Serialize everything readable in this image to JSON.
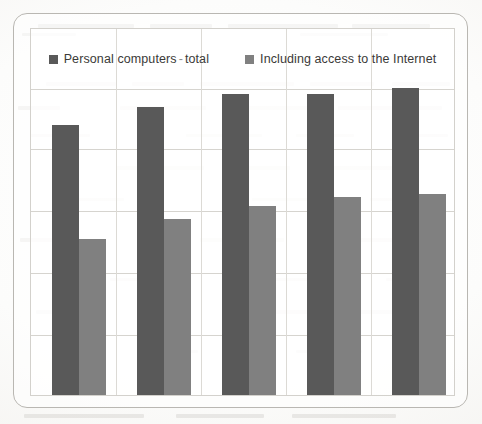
{
  "figure": {
    "frame_color": "#b9b7b2",
    "plot_border_color": "#d3d1cc",
    "background_color": "#ffffff"
  },
  "legend": {
    "position": "top-center",
    "entries": [
      {
        "label": "Personal computers",
        "suffix": "total",
        "separator": "-",
        "color": "#595959",
        "swatch": "legend-swatch-dark"
      },
      {
        "label": "Including access to the Internet",
        "suffix": "",
        "separator": "",
        "color": "#808080",
        "swatch": "legend-swatch-light"
      }
    ]
  },
  "chart_data": {
    "type": "bar",
    "title": "",
    "subtitle": "",
    "xlabel": "",
    "ylabel": "",
    "categories": [
      "1",
      "2",
      "3",
      "4",
      "5"
    ],
    "tick_labels_visible": false,
    "grid": true,
    "gridlines_horizontal": 5,
    "gridlines_vertical": 4,
    "legend_position": "top",
    "ylim": [
      0,
      100
    ],
    "series": [
      {
        "name": "Personal computers - total",
        "color": "#595959",
        "values": [
          73.7,
          78.8,
          82.3,
          82.3,
          84.0
        ]
      },
      {
        "name": "Including access to the Internet",
        "color": "#808080",
        "values": [
          42.7,
          48.1,
          51.6,
          54.1,
          54.9
        ]
      }
    ]
  }
}
